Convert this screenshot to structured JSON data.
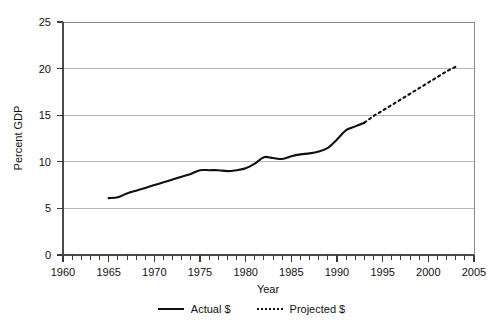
{
  "chart_data": {
    "type": "line",
    "title": "",
    "xlabel": "Year",
    "ylabel": "Percent GDP",
    "xlim": [
      1960,
      2005
    ],
    "ylim": [
      0,
      25
    ],
    "grid": "horizontal",
    "legend_position": "bottom",
    "x_ticks": [
      1960,
      1965,
      1970,
      1975,
      1980,
      1985,
      1990,
      1995,
      2000,
      2005
    ],
    "x_tick_labels": [
      "1960",
      "1965",
      "1970",
      "1975",
      "1980",
      "1985",
      "1990",
      "1995",
      "2000",
      "2005"
    ],
    "x_minor_tick_step": 1,
    "y_ticks": [
      0,
      5,
      10,
      15,
      20,
      25
    ],
    "y_tick_labels": [
      "0",
      "5",
      "10",
      "15",
      "20",
      "25"
    ],
    "series": [
      {
        "name": "Actual $",
        "style": "solid",
        "color": "#101010",
        "x": [
          1965,
          1966,
          1967,
          1968,
          1969,
          1970,
          1971,
          1972,
          1973,
          1974,
          1975,
          1976,
          1977,
          1978,
          1979,
          1980,
          1981,
          1982,
          1983,
          1984,
          1985,
          1986,
          1987,
          1988,
          1989,
          1990,
          1991,
          1992,
          1993
        ],
        "values": [
          6.1,
          6.2,
          6.6,
          6.9,
          7.2,
          7.5,
          7.8,
          8.1,
          8.4,
          8.7,
          9.1,
          9.1,
          9.1,
          9.0,
          9.1,
          9.3,
          9.8,
          10.5,
          10.4,
          10.3,
          10.6,
          10.8,
          10.9,
          11.1,
          11.5,
          12.4,
          13.4,
          13.8,
          14.2
        ]
      },
      {
        "name": "Projected $",
        "style": "dotted",
        "color": "#101010",
        "x": [
          1993,
          1994,
          1995,
          1996,
          1997,
          1998,
          1999,
          2000,
          2001,
          2002,
          2003
        ],
        "values": [
          14.2,
          14.9,
          15.5,
          16.1,
          16.7,
          17.3,
          17.9,
          18.5,
          19.1,
          19.7,
          20.2
        ]
      }
    ]
  },
  "axis": {
    "y_title": "Percent GDP",
    "x_title": "Year",
    "y_labels": [
      "25",
      "20",
      "15",
      "10",
      "5",
      "0"
    ],
    "x_labels": [
      "1960",
      "1965",
      "1970",
      "1975",
      "1980",
      "1985",
      "1990",
      "1995",
      "2000",
      "2005"
    ]
  },
  "legend": {
    "items": [
      {
        "label": "Actual $",
        "style": "solid"
      },
      {
        "label": "Projected $",
        "style": "dotted"
      }
    ]
  }
}
